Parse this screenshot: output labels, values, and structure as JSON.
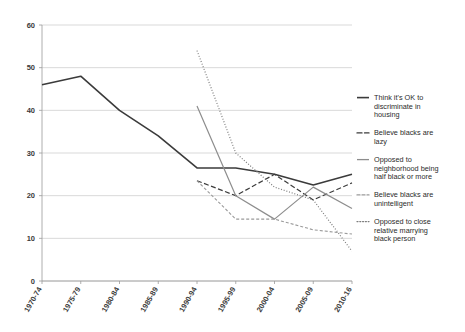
{
  "chart_data": {
    "type": "line",
    "title": "",
    "xlabel": "",
    "ylabel": "",
    "ylim": [
      0,
      60
    ],
    "ytick_step": 10,
    "grid": true,
    "legend_position": "right",
    "yticks": [
      "0",
      "10",
      "20",
      "30",
      "40",
      "50",
      "60"
    ],
    "categories": [
      "1970-74",
      "1975-79",
      "1980-84",
      "1985-89",
      "1990-94",
      "1995-99",
      "2000-04",
      "2005-09",
      "2010-16"
    ],
    "series": [
      {
        "name": "Think it's OK to discriminate in housing",
        "legend_label": "Think it's OK to\ndiscriminate in\nhousing",
        "style": "solid",
        "color": "#3b3b3b",
        "width": 1.6,
        "values": [
          46,
          48,
          40,
          34,
          26.5,
          26.5,
          25,
          22.5,
          25
        ]
      },
      {
        "name": "Believe blacks are lazy",
        "legend_label": "Believe blacks are\nlazy",
        "style": "dashed",
        "color": "#3b3b3b",
        "width": 1.2,
        "values": [
          null,
          null,
          null,
          null,
          23.5,
          20,
          25,
          19,
          23
        ]
      },
      {
        "name": "Opposed to neighborhood being half black or more",
        "legend_label": "Opposed to\nneighborhood being\nhalf black or more",
        "style": "solid",
        "color": "#8d8d8d",
        "width": 1.2,
        "values": [
          null,
          null,
          null,
          null,
          41,
          20,
          14.5,
          22,
          17
        ]
      },
      {
        "name": "Believe blacks are unintelligent",
        "legend_label": "Believe blacks are\nunintelligent",
        "style": "dashed-fine",
        "color": "#9a9a9a",
        "width": 1.1,
        "values": [
          null,
          null,
          null,
          null,
          23.5,
          14.5,
          14.5,
          12,
          11
        ]
      },
      {
        "name": "Opposed to close relative marrying black person",
        "legend_label": "Opposed to close\nrelative marrying\nblack person",
        "style": "dotted",
        "color": "#7d7d7d",
        "width": 1.2,
        "values": [
          null,
          null,
          null,
          null,
          54,
          30,
          22,
          19,
          7
        ]
      }
    ]
  }
}
